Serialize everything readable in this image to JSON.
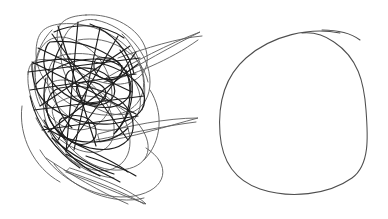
{
  "canvas": {
    "width": 388,
    "height": 219,
    "background_color": "#ffffff",
    "title": "Hand-drawn sketch comparison"
  },
  "panels": [
    {
      "id": "scribble",
      "name": "dense-scribble-drawing",
      "caption": "",
      "ink_color": "#1c1c1c",
      "ink_color_light": "#5a5a5a",
      "stroke_width": 1.1,
      "bounds": {
        "x": 15,
        "y": 12,
        "width": 190,
        "height": 196
      },
      "description": "Dense chaotic scribble of many overlapping hand-drawn ellipses and loops, with long thin spike tails extending to the right"
    },
    {
      "id": "circle",
      "name": "single-circle-drawing",
      "caption": "",
      "ink_color": "#4e4e4e",
      "stroke_width": 1.0,
      "bounds": {
        "x": 222,
        "y": 32,
        "width": 144,
        "height": 164
      },
      "description": "A single clean hand-drawn closed circle with a small overshoot tail at the top"
    }
  ]
}
